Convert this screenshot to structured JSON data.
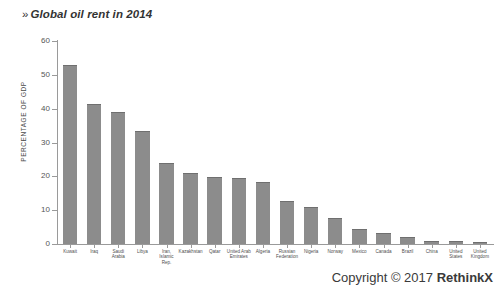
{
  "title": "Global oil rent in 2014",
  "title_prefix": "»",
  "footer": {
    "copyright_prefix": "Copyright © 2017 ",
    "brand": "RethinkX"
  },
  "colors": {
    "bar": "#8c8c8c",
    "bar_edge": "#6f6f6f",
    "axis": "#9a9a9a",
    "text": "#3d3d3d"
  },
  "chart_data": {
    "type": "bar",
    "title": "Global oil rent in 2014",
    "xlabel": "",
    "ylabel": "PERCENTAGE OF GDP",
    "ylim": [
      0,
      60
    ],
    "yticks": [
      0,
      10,
      20,
      30,
      40,
      50,
      60
    ],
    "grid": false,
    "legend": false,
    "categories": [
      "Kuwait",
      "Iraq",
      "Saudi Arabia",
      "Libya",
      "Iran, Islamic Rep.",
      "Kazakhstan",
      "Qatar",
      "United Arab Emirates",
      "Algeria",
      "Russian Federation",
      "Nigeria",
      "Norway",
      "Mexico",
      "Canada",
      "Brazil",
      "China",
      "United States",
      "United Kingdom"
    ],
    "values": [
      53.0,
      41.5,
      39.0,
      33.5,
      23.8,
      21.0,
      19.8,
      19.5,
      18.4,
      12.8,
      11.0,
      7.6,
      4.5,
      3.4,
      2.1,
      1.0,
      0.8,
      0.6
    ]
  }
}
